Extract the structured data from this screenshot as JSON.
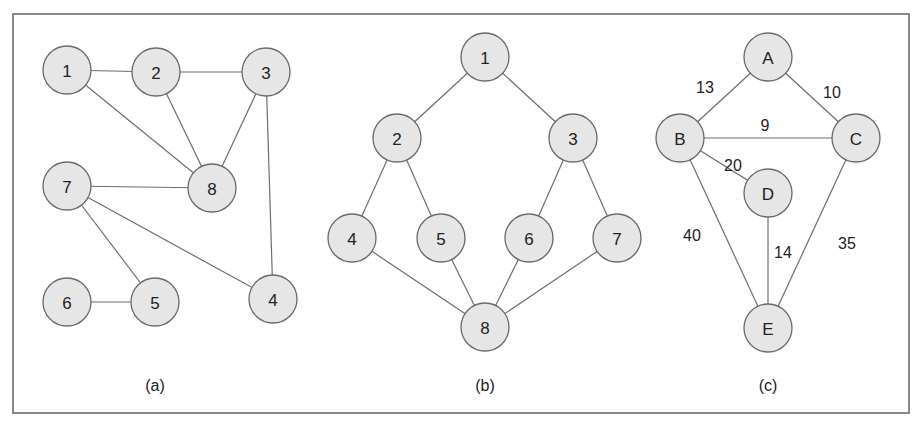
{
  "colors": {
    "node_fill": "#e6e6e6",
    "node_stroke": "#6a6a6a",
    "edge": "#6e6e6e",
    "frame": "#8a8a8a",
    "text": "#222222"
  },
  "frame": {
    "x": 13,
    "y": 14,
    "width": 896,
    "height": 399
  },
  "node_radius": 24,
  "graphs": [
    {
      "id": "a",
      "caption": "(a)",
      "caption_pos": [
        155,
        385
      ],
      "nodes": [
        {
          "id": "1",
          "label": "1",
          "x": 67,
          "y": 70
        },
        {
          "id": "2",
          "label": "2",
          "x": 156,
          "y": 72
        },
        {
          "id": "3",
          "label": "3",
          "x": 266,
          "y": 72
        },
        {
          "id": "7",
          "label": "7",
          "x": 67,
          "y": 186
        },
        {
          "id": "8",
          "label": "8",
          "x": 212,
          "y": 188
        },
        {
          "id": "6",
          "label": "6",
          "x": 67,
          "y": 302
        },
        {
          "id": "5",
          "label": "5",
          "x": 155,
          "y": 302
        },
        {
          "id": "4",
          "label": "4",
          "x": 273,
          "y": 299
        }
      ],
      "edges": [
        {
          "from": "1",
          "to": "2"
        },
        {
          "from": "2",
          "to": "3"
        },
        {
          "from": "1",
          "to": "8"
        },
        {
          "from": "2",
          "to": "8"
        },
        {
          "from": "3",
          "to": "8"
        },
        {
          "from": "3",
          "to": "4"
        },
        {
          "from": "7",
          "to": "8"
        },
        {
          "from": "7",
          "to": "4"
        },
        {
          "from": "7",
          "to": "5"
        },
        {
          "from": "6",
          "to": "5"
        }
      ]
    },
    {
      "id": "b",
      "caption": "(b)",
      "caption_pos": [
        485,
        385
      ],
      "nodes": [
        {
          "id": "1",
          "label": "1",
          "x": 485,
          "y": 57
        },
        {
          "id": "2",
          "label": "2",
          "x": 397,
          "y": 138
        },
        {
          "id": "3",
          "label": "3",
          "x": 573,
          "y": 138
        },
        {
          "id": "4",
          "label": "4",
          "x": 352,
          "y": 238
        },
        {
          "id": "5",
          "label": "5",
          "x": 441,
          "y": 238
        },
        {
          "id": "6",
          "label": "6",
          "x": 529,
          "y": 238
        },
        {
          "id": "7",
          "label": "7",
          "x": 617,
          "y": 238
        },
        {
          "id": "8",
          "label": "8",
          "x": 485,
          "y": 327
        }
      ],
      "edges": [
        {
          "from": "1",
          "to": "2"
        },
        {
          "from": "1",
          "to": "3"
        },
        {
          "from": "2",
          "to": "4"
        },
        {
          "from": "2",
          "to": "5"
        },
        {
          "from": "3",
          "to": "6"
        },
        {
          "from": "3",
          "to": "7"
        },
        {
          "from": "4",
          "to": "8"
        },
        {
          "from": "5",
          "to": "8"
        },
        {
          "from": "6",
          "to": "8"
        },
        {
          "from": "7",
          "to": "8"
        }
      ]
    },
    {
      "id": "c",
      "caption": "(c)",
      "caption_pos": [
        768,
        385
      ],
      "nodes": [
        {
          "id": "A",
          "label": "A",
          "x": 768,
          "y": 57
        },
        {
          "id": "B",
          "label": "B",
          "x": 680,
          "y": 138
        },
        {
          "id": "C",
          "label": "C",
          "x": 856,
          "y": 138
        },
        {
          "id": "D",
          "label": "D",
          "x": 768,
          "y": 193
        },
        {
          "id": "E",
          "label": "E",
          "x": 768,
          "y": 328
        }
      ],
      "edges": [
        {
          "from": "A",
          "to": "B",
          "weight": "13",
          "label_pos": [
            705,
            87
          ]
        },
        {
          "from": "A",
          "to": "C",
          "weight": "10",
          "label_pos": [
            832,
            92
          ]
        },
        {
          "from": "B",
          "to": "C",
          "weight": "9",
          "label_pos": [
            765,
            125
          ]
        },
        {
          "from": "B",
          "to": "D",
          "weight": "20",
          "label_pos": [
            733,
            165
          ]
        },
        {
          "from": "B",
          "to": "E",
          "weight": "40",
          "label_pos": [
            692,
            235
          ]
        },
        {
          "from": "D",
          "to": "E",
          "weight": "14",
          "label_pos": [
            783,
            252
          ]
        },
        {
          "from": "C",
          "to": "E",
          "weight": "35",
          "label_pos": [
            847,
            243
          ]
        }
      ]
    }
  ]
}
